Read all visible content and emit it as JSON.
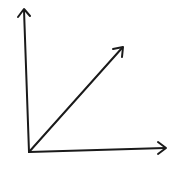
{
  "diagram": {
    "type": "vector-axes",
    "stroke_color": "#1a1a1a",
    "background": "#ffffff",
    "origin": [
      29,
      152
    ],
    "arrows": [
      {
        "name": "vertical-axis",
        "tip": [
          24,
          9
        ]
      },
      {
        "name": "horizontal-axis",
        "tip": [
          166,
          148
        ]
      },
      {
        "name": "diagonal-vector",
        "tip": [
          123,
          47
        ]
      }
    ],
    "labels": []
  }
}
